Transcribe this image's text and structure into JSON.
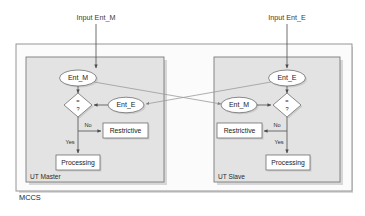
{
  "diagram": {
    "outer_container_label": "MCCS",
    "inputs": [
      {
        "id": "input-ent-m",
        "label": "Input Ent_M"
      },
      {
        "id": "input-ent-e",
        "label": "Input Ent_E"
      }
    ],
    "panels": [
      {
        "id": "ut-master",
        "label": "UT Master",
        "top_entity": "Ent_M",
        "side_entity": "Ent_E",
        "decision": {
          "operator": "=",
          "query": "?"
        },
        "branch_no_label": "No",
        "branch_yes_label": "Yes",
        "restrictive_label": "Restrictive",
        "processing_label": "Processing"
      },
      {
        "id": "ut-slave",
        "label": "UT Slave",
        "top_entity": "Ent_E",
        "side_entity": "Ent_M",
        "decision": {
          "operator": "=",
          "query": "?"
        },
        "branch_no_label": "No",
        "branch_yes_label": "Yes",
        "restrictive_label": "Restrictive",
        "processing_label": "Processing"
      }
    ],
    "colors": {
      "panel_fill": "#e3e3e3",
      "outer_fill": "#fbfbfb",
      "shape_fill": "#ffffff",
      "shape_stroke": "#6e6e6e",
      "flow_stroke": "#555555",
      "cross_stroke": "#9a9a9a",
      "text": "#1a1a1a",
      "background": "#ffffff"
    }
  }
}
